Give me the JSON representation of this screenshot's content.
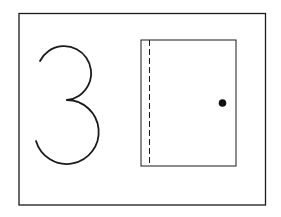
{
  "card": {
    "numeral": "3",
    "picture": "door",
    "colors": {
      "background": "#ffffff",
      "stroke": "#1a1a1a",
      "knob": "#111111"
    }
  }
}
